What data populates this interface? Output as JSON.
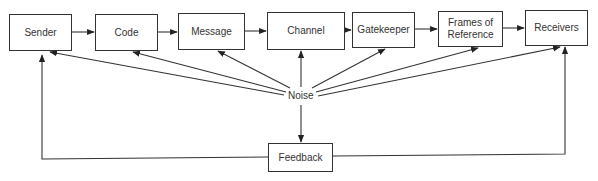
{
  "nodes": [
    {
      "id": "sender",
      "label": "Sender"
    },
    {
      "id": "code",
      "label": "Code"
    },
    {
      "id": "message",
      "label": "Message"
    },
    {
      "id": "channel",
      "label": "Channel"
    },
    {
      "id": "gatekeeper",
      "label": "Gatekeeper"
    },
    {
      "id": "frames",
      "label": "Frames of Reference"
    },
    {
      "id": "receivers",
      "label": "Receivers"
    },
    {
      "id": "noise",
      "label": "Noise"
    },
    {
      "id": "feedback",
      "label": "Feedback"
    }
  ],
  "edges": [
    [
      "sender",
      "code"
    ],
    [
      "code",
      "message"
    ],
    [
      "message",
      "channel"
    ],
    [
      "channel",
      "gatekeeper"
    ],
    [
      "gatekeeper",
      "frames"
    ],
    [
      "frames",
      "receivers"
    ],
    [
      "noise",
      "sender"
    ],
    [
      "noise",
      "code"
    ],
    [
      "noise",
      "message"
    ],
    [
      "noise",
      "channel"
    ],
    [
      "noise",
      "gatekeeper"
    ],
    [
      "noise",
      "frames"
    ],
    [
      "noise",
      "receivers"
    ],
    [
      "noise",
      "feedback"
    ],
    [
      "feedback",
      "sender"
    ],
    [
      "feedback",
      "receivers"
    ]
  ]
}
